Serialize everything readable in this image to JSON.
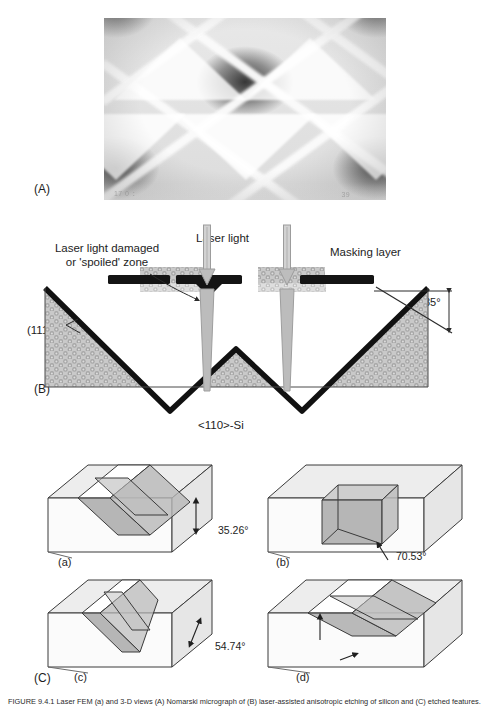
{
  "figure": {
    "panels": [
      {
        "tag": "(A)",
        "kind": "sem-micrograph"
      },
      {
        "tag": "(B)",
        "kind": "cross-section-schematic"
      },
      {
        "tag": "(C)",
        "kind": "3d-block-diagrams"
      }
    ]
  },
  "panel_a": {
    "tag": "(A)",
    "sem_overlay": {
      "left": "17 0 ：",
      "right": "39"
    }
  },
  "panel_b": {
    "tag": "(B)",
    "labels": {
      "damaged_zone_line1": "Laser light damaged",
      "damaged_zone_line2": "or 'spoiled' zone",
      "laser_light": "Laser light",
      "masking_layer": "Masking layer",
      "plane": "(111)",
      "angle": "35°",
      "substrate": "<110>-Si"
    }
  },
  "panel_c": {
    "tag": "(C)",
    "subpanels": [
      {
        "tag": "(a)",
        "angle": "35.26°",
        "shape": "v-groove-intersecting-planes"
      },
      {
        "tag": "(b)",
        "angle": "70.53°",
        "shape": "vertical-walled-cube-cavity"
      },
      {
        "tag": "(c)",
        "angle": "54.74°",
        "shape": "narrow-v-groove"
      },
      {
        "tag": "(d)",
        "angle": "70.53°",
        "shape": "inclined-slab-groove"
      }
    ]
  },
  "caption": {
    "text": "FIGURE 9.4.1  Laser FEM (a) and 3-D views (A) Nomarski micrograph of (B) laser-assisted anisotropic etching of silicon and (C) etched features."
  },
  "colors": {
    "ink": "#1d1d1d",
    "mask": "#1a1a1a",
    "substrate_fill": "#b8b8b8",
    "damaged_zone": "#9a9a9a",
    "block_top": "#e4e4e4",
    "block_side": "#f4f4f4",
    "plane_shade": "#a8a8a8",
    "plane_shade_light": "#c4c4c4"
  }
}
